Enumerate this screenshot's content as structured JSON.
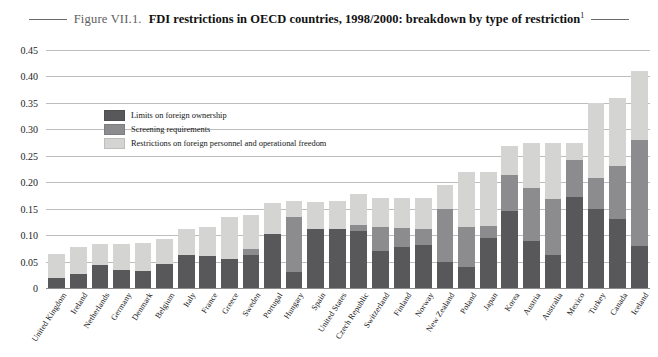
{
  "figure": {
    "number": "Figure VII.1.",
    "title": "FDI restrictions in OECD countries, 1998/2000: breakdown by type of restriction",
    "title_footnote": "1"
  },
  "legend": {
    "position": "top-left-inside",
    "items": [
      {
        "label": "Limits on foreign ownership",
        "color": "#58585a",
        "key": "limits"
      },
      {
        "label": "Screening requirements",
        "color": "#8c8c8e",
        "key": "screening"
      },
      {
        "label": "Restrictions on foreign personnel and operational freedom",
        "color": "#d4d4d2",
        "key": "restrictions"
      }
    ]
  },
  "chart_data": {
    "type": "bar",
    "stacked": true,
    "title": "FDI restrictions in OECD countries, 1998/2000: breakdown by type of restriction",
    "xlabel": "",
    "ylabel": "",
    "ylim": [
      0,
      0.45
    ],
    "grid": true,
    "yticks": [
      "0",
      "0.05",
      "0.10",
      "0.15",
      "0.20",
      "0.25",
      "0.30",
      "0.35",
      "0.40",
      "0.45"
    ],
    "ytick_values": [
      0,
      0.05,
      0.1,
      0.15,
      0.2,
      0.25,
      0.3,
      0.35,
      0.4,
      0.45
    ],
    "categories": [
      "United Kingdom",
      "Ireland",
      "Netherlands",
      "Germany",
      "Denmark",
      "Belgium",
      "Italy",
      "France",
      "Greece",
      "Sweden",
      "Portugal",
      "Hungary",
      "Spain",
      "United States",
      "Czech Republic",
      "Switzerland",
      "Finland",
      "Norway",
      "New Zealand",
      "Poland",
      "Japan",
      "Korea",
      "Austria",
      "Australia",
      "Mexico",
      "Turkey",
      "Canada",
      "Iceland"
    ],
    "series": [
      {
        "name": "Limits on foreign ownership",
        "color": "#58585a",
        "values": [
          0.018,
          0.027,
          0.043,
          0.035,
          0.032,
          0.045,
          0.062,
          0.06,
          0.055,
          0.062,
          0.102,
          0.03,
          0.112,
          0.112,
          0.108,
          0.07,
          0.078,
          0.082,
          0.05,
          0.04,
          0.095,
          0.145,
          0.088,
          0.063,
          0.172,
          0.15,
          0.13,
          0.08
        ]
      },
      {
        "name": "Screening requirements",
        "color": "#8c8c8e",
        "values": [
          0.0,
          0.0,
          0.0,
          0.0,
          0.0,
          0.0,
          0.0,
          0.0,
          0.0,
          0.012,
          0.0,
          0.105,
          0.0,
          0.0,
          0.012,
          0.045,
          0.035,
          0.03,
          0.1,
          0.075,
          0.022,
          0.068,
          0.102,
          0.105,
          0.07,
          0.058,
          0.1,
          0.2
        ]
      },
      {
        "name": "Restrictions on foreign personnel and operational freedom",
        "color": "#d4d4d2",
        "values": [
          0.047,
          0.05,
          0.04,
          0.048,
          0.053,
          0.048,
          0.05,
          0.055,
          0.08,
          0.064,
          0.058,
          0.03,
          0.05,
          0.053,
          0.057,
          0.055,
          0.057,
          0.058,
          0.045,
          0.105,
          0.103,
          0.055,
          0.085,
          0.107,
          0.033,
          0.142,
          0.13,
          0.13
        ]
      }
    ],
    "totals": [
      0.065,
      0.077,
      0.083,
      0.083,
      0.085,
      0.093,
      0.112,
      0.115,
      0.135,
      0.138,
      0.16,
      0.165,
      0.162,
      0.165,
      0.177,
      0.17,
      0.17,
      0.17,
      0.195,
      0.22,
      0.22,
      0.268,
      0.275,
      0.275,
      0.275,
      0.35,
      0.36,
      0.41
    ]
  }
}
